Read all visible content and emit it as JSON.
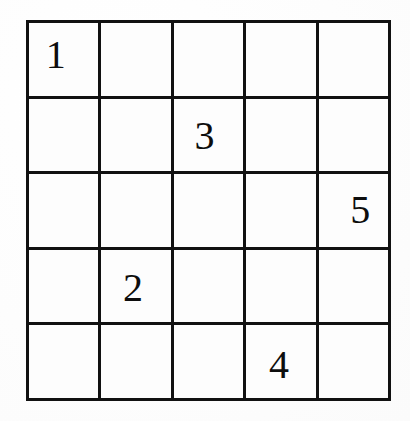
{
  "puzzle": {
    "type": "number-grid-puzzle",
    "rows": 5,
    "columns": 5,
    "ink_color": "#111111",
    "cell_color": "#fdfdfd",
    "page_color": "#ffffff",
    "given_count": 5,
    "givens": [
      {
        "row": 1,
        "column": 1,
        "value": "1"
      },
      {
        "row": 2,
        "column": 3,
        "value": "3"
      },
      {
        "row": 3,
        "column": 5,
        "value": "5"
      },
      {
        "row": 4,
        "column": 2,
        "value": "2"
      },
      {
        "row": 5,
        "column": 4,
        "value": "4"
      }
    ],
    "cells": [
      [
        {
          "pos": "r1c1",
          "value": "1"
        },
        {
          "pos": "r1c2",
          "value": ""
        },
        {
          "pos": "r1c3",
          "value": ""
        },
        {
          "pos": "r1c4",
          "value": ""
        },
        {
          "pos": "r1c5",
          "value": ""
        }
      ],
      [
        {
          "pos": "r2c1",
          "value": ""
        },
        {
          "pos": "r2c2",
          "value": ""
        },
        {
          "pos": "r2c3",
          "value": "3"
        },
        {
          "pos": "r2c4",
          "value": ""
        },
        {
          "pos": "r2c5",
          "value": ""
        }
      ],
      [
        {
          "pos": "r3c1",
          "value": ""
        },
        {
          "pos": "r3c2",
          "value": ""
        },
        {
          "pos": "r3c3",
          "value": ""
        },
        {
          "pos": "r3c4",
          "value": ""
        },
        {
          "pos": "r3c5",
          "value": "5"
        }
      ],
      [
        {
          "pos": "r4c1",
          "value": ""
        },
        {
          "pos": "r4c2",
          "value": "2"
        },
        {
          "pos": "r4c3",
          "value": ""
        },
        {
          "pos": "r4c4",
          "value": ""
        },
        {
          "pos": "r4c5",
          "value": ""
        }
      ],
      [
        {
          "pos": "r5c1",
          "value": ""
        },
        {
          "pos": "r5c2",
          "value": ""
        },
        {
          "pos": "r5c3",
          "value": ""
        },
        {
          "pos": "r5c4",
          "value": "4"
        },
        {
          "pos": "r5c5",
          "value": ""
        }
      ]
    ]
  }
}
